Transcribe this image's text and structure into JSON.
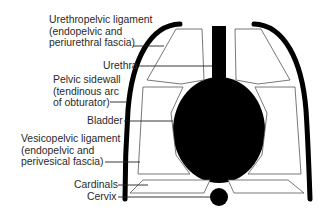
{
  "diagram": {
    "labels": {
      "urethropelvic": [
        "Urethropelvic ligament",
        "(endopelvic and",
        "periurethral fascia)"
      ],
      "urethra": "Urethra",
      "pelvic_sidewall": [
        "Pelvic sidewall",
        "(tendinous arc",
        "of obturator)"
      ],
      "bladder": "Bladder",
      "vesicopelvic": [
        "Vesicopelvic ligament",
        "(endopelvic and",
        "perivesical fascia)"
      ],
      "cardinals": "Cardinals",
      "cervix": "Cervix"
    },
    "colors": {
      "ink": "#000000",
      "outline": "#555555",
      "text": "#2a2a2a",
      "background": "#ffffff"
    }
  }
}
